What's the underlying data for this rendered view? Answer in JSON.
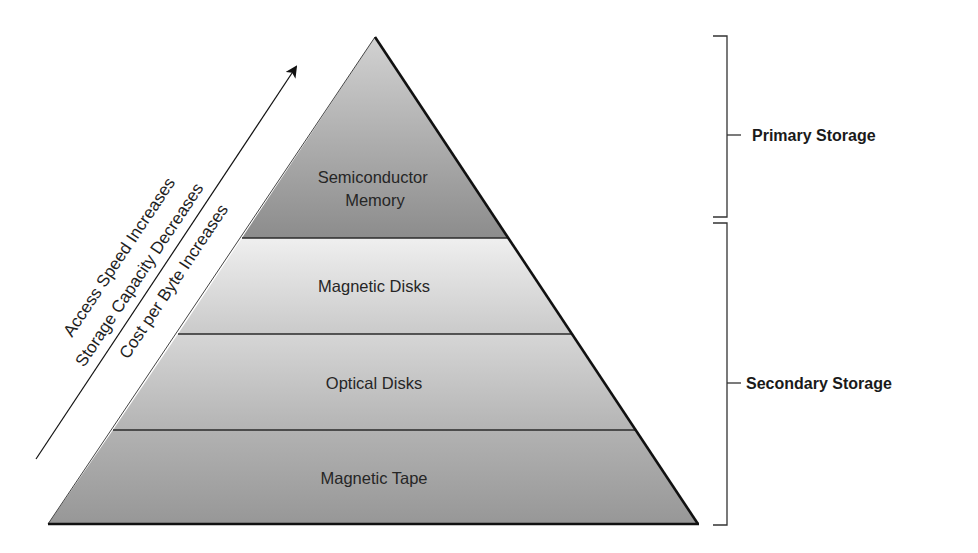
{
  "diagram": {
    "type": "pyramid",
    "layers": [
      {
        "label_lines": [
          "Semiconductor",
          "Memory"
        ],
        "tier": "primary",
        "fill_top": "#cfcfcf",
        "fill_bottom": "#8e8e8e"
      },
      {
        "label_lines": [
          "Magnetic Disks"
        ],
        "tier": "secondary",
        "fill_top": "#ececec",
        "fill_bottom": "#cbcbcb"
      },
      {
        "label_lines": [
          "Optical Disks"
        ],
        "tier": "secondary",
        "fill_top": "#d8d8d8",
        "fill_bottom": "#b6b6b6"
      },
      {
        "label_lines": [
          "Magnetic Tape"
        ],
        "tier": "secondary",
        "fill_top": "#b0b0b0",
        "fill_bottom": "#999999"
      }
    ],
    "arrow": {
      "direction": "up-right",
      "labels": [
        "Access Speed Increases",
        "Storage Capacity Decreases",
        "Cost per Byte Increases"
      ]
    },
    "brackets": [
      {
        "label": "Primary Storage",
        "covers": [
          "Semiconductor Memory"
        ]
      },
      {
        "label": "Secondary Storage",
        "covers": [
          "Magnetic Disks",
          "Optical Disks",
          "Magnetic Tape"
        ]
      }
    ],
    "colors": {
      "outline": "#1a1a1a",
      "divider": "#2a2a2a",
      "text": "#262626"
    }
  }
}
